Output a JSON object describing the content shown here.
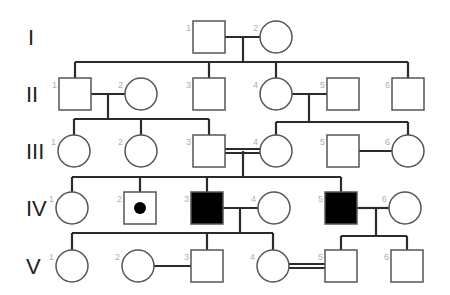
{
  "colors": {
    "line": "#2b2b2b",
    "symbol_stroke": "#555555",
    "affected_fill": "#000000",
    "unaffected_fill": "#ffffff",
    "number": "#b0b0b0",
    "label": "#222222"
  },
  "generations": [
    {
      "label": "I",
      "y": 37,
      "individuals": [
        {
          "num": "1",
          "sex": "male",
          "status": "unaffected",
          "cx": 209
        },
        {
          "num": "2",
          "sex": "female",
          "status": "unaffected",
          "cx": 276
        }
      ]
    },
    {
      "label": "II",
      "y": 94,
      "individuals": [
        {
          "num": "1",
          "sex": "male",
          "status": "unaffected",
          "cx": 75
        },
        {
          "num": "2",
          "sex": "female",
          "status": "unaffected",
          "cx": 141
        },
        {
          "num": "3",
          "sex": "male",
          "status": "unaffected",
          "cx": 209
        },
        {
          "num": "4",
          "sex": "female",
          "status": "unaffected",
          "cx": 276
        },
        {
          "num": "5",
          "sex": "male",
          "status": "unaffected",
          "cx": 343
        },
        {
          "num": "6",
          "sex": "male",
          "status": "unaffected",
          "cx": 408
        }
      ]
    },
    {
      "label": "III",
      "y": 151,
      "individuals": [
        {
          "num": "1",
          "sex": "female",
          "status": "unaffected",
          "cx": 74
        },
        {
          "num": "2",
          "sex": "female",
          "status": "unaffected",
          "cx": 141
        },
        {
          "num": "3",
          "sex": "male",
          "status": "unaffected",
          "cx": 209
        },
        {
          "num": "4",
          "sex": "female",
          "status": "unaffected",
          "cx": 276
        },
        {
          "num": "5",
          "sex": "male",
          "status": "unaffected",
          "cx": 343
        },
        {
          "num": "6",
          "sex": "female",
          "status": "unaffected",
          "cx": 408
        }
      ]
    },
    {
      "label": "IV",
      "y": 208,
      "individuals": [
        {
          "num": "1",
          "sex": "female",
          "status": "unaffected",
          "cx": 72
        },
        {
          "num": "2",
          "sex": "male",
          "status": "carrier",
          "cx": 140
        },
        {
          "num": "3",
          "sex": "male",
          "status": "affected",
          "cx": 207
        },
        {
          "num": "4",
          "sex": "female",
          "status": "unaffected",
          "cx": 274
        },
        {
          "num": "5",
          "sex": "male",
          "status": "affected",
          "cx": 341
        },
        {
          "num": "6",
          "sex": "female",
          "status": "unaffected",
          "cx": 405
        }
      ]
    },
    {
      "label": "V",
      "y": 266,
      "individuals": [
        {
          "num": "1",
          "sex": "female",
          "status": "unaffected",
          "cx": 72
        },
        {
          "num": "2",
          "sex": "female",
          "status": "unaffected",
          "cx": 138
        },
        {
          "num": "3",
          "sex": "male",
          "status": "unaffected",
          "cx": 207
        },
        {
          "num": "4",
          "sex": "female",
          "status": "unaffected",
          "cx": 273
        },
        {
          "num": "5",
          "sex": "male",
          "status": "unaffected",
          "cx": 341
        },
        {
          "num": "6",
          "sex": "male",
          "status": "unaffected",
          "cx": 407
        }
      ]
    }
  ],
  "matings": [
    {
      "gen": 0,
      "a": 0,
      "b": 1,
      "type": "single",
      "drop_x": 243,
      "sib_y": 62,
      "children_gen": 1,
      "children": [
        0,
        2,
        3,
        5
      ]
    },
    {
      "gen": 1,
      "a": 0,
      "b": 1,
      "type": "single",
      "drop_x": 108,
      "sib_y": 119,
      "children_gen": 2,
      "children": [
        0,
        1,
        2
      ]
    },
    {
      "gen": 1,
      "a": 3,
      "b": 4,
      "type": "single",
      "drop_x": 309,
      "sib_y": 122,
      "children_gen": 2,
      "children": [
        3,
        5
      ]
    },
    {
      "gen": 2,
      "a": 2,
      "b": 3,
      "type": "consanguineous",
      "drop_x": 243,
      "sib_y": 177,
      "children_gen": 3,
      "children": [
        0,
        1,
        2,
        4
      ]
    },
    {
      "gen": 2,
      "a": 4,
      "b": 5,
      "type": "single",
      "drop_x": null,
      "sib_y": null,
      "children_gen": null,
      "children": []
    },
    {
      "gen": 3,
      "a": 2,
      "b": 3,
      "type": "single",
      "drop_x": 240,
      "sib_y": 233,
      "children_gen": 4,
      "children": [
        0,
        2,
        3
      ]
    },
    {
      "gen": 3,
      "a": 4,
      "b": 5,
      "type": "single",
      "drop_x": 376,
      "sib_y": 236,
      "children_gen": 4,
      "children": [
        4,
        5
      ]
    },
    {
      "gen": 4,
      "a": 1,
      "b": 2,
      "type": "single",
      "drop_x": null,
      "sib_y": null,
      "children_gen": null,
      "children": []
    },
    {
      "gen": 4,
      "a": 3,
      "b": 4,
      "type": "consanguineous",
      "drop_x": null,
      "sib_y": null,
      "children_gen": null,
      "children": []
    }
  ]
}
